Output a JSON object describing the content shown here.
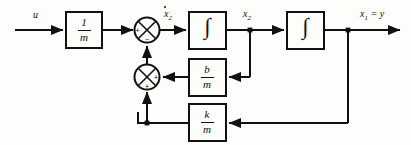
{
  "diagram": {
    "type": "control-system-block-diagram",
    "stroke_color": "#111111",
    "background_color": "#fdfdfc",
    "canvas": {
      "width": 411,
      "height": 145
    }
  },
  "signals": {
    "input": "u",
    "sum1_output": "ẋ₂",
    "sum1_output_base": "x",
    "sum1_output_sub": "2",
    "mid_state": "x",
    "mid_state_sub": "2",
    "output": "x",
    "output_sub": "1",
    "output_eq": " = y",
    "output_full": "x₁ = y"
  },
  "blocks": [
    {
      "id": "gain-1-over-m",
      "name": "gain-block-one-over-m",
      "numerator": "1",
      "denominator": "m",
      "label": "1/m"
    },
    {
      "id": "integrator-1",
      "name": "integrator-block-first",
      "symbol": "∫",
      "label": "∫"
    },
    {
      "id": "integrator-2",
      "name": "integrator-block-second",
      "symbol": "∫",
      "label": "∫"
    },
    {
      "id": "gain-b-over-m",
      "name": "gain-block-b-over-m",
      "numerator": "b",
      "denominator": "m",
      "label": "b/m"
    },
    {
      "id": "gain-k-over-m",
      "name": "gain-block-k-over-m",
      "numerator": "k",
      "denominator": "m",
      "label": "k/m"
    }
  ],
  "summing_junctions": [
    {
      "id": "summer-1",
      "name": "summing-junction-top",
      "left_sign": "+",
      "bottom_sign": "−",
      "signs": [
        "+",
        "−"
      ]
    },
    {
      "id": "summer-2",
      "name": "summing-junction-lower",
      "right_sign": "+",
      "bottom_sign": "+",
      "signs": [
        "+",
        "+"
      ]
    }
  ],
  "connections": [
    {
      "name": "input-to-gain",
      "from": "u",
      "to": "gain-1-over-m"
    },
    {
      "name": "gain-to-summer1",
      "from": "gain-1-over-m",
      "to": "summer-1"
    },
    {
      "name": "summer1-to-integrator1",
      "from": "summer-1",
      "to": "integrator-1",
      "label": "ẋ₂"
    },
    {
      "name": "integrator1-to-integrator2",
      "from": "integrator-1",
      "to": "integrator-2",
      "label": "x₂"
    },
    {
      "name": "integrator2-to-output",
      "from": "integrator-2",
      "to": "x₁ = y"
    },
    {
      "name": "x2-branch-to-damping-gain",
      "from": "x₂",
      "to": "gain-b-over-m"
    },
    {
      "name": "damping-gain-to-summer2",
      "from": "gain-b-over-m",
      "to": "summer-2"
    },
    {
      "name": "summer2-to-summer1",
      "from": "summer-2",
      "to": "summer-1"
    },
    {
      "name": "output-branch-to-spring-gain",
      "from": "x₁ = y",
      "to": "gain-k-over-m"
    },
    {
      "name": "spring-gain-to-summer2",
      "from": "gain-k-over-m",
      "to": "summer-2"
    }
  ]
}
